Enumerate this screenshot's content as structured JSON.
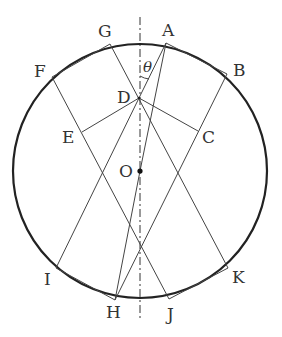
{
  "diagram": {
    "type": "geometry",
    "colors": {
      "stroke": "#333333",
      "circle": "#222222",
      "background": "#ffffff"
    },
    "circle": {
      "center_label": "O"
    },
    "points": {
      "A": "A",
      "B": "B",
      "C": "C",
      "D": "D",
      "E": "E",
      "F": "F",
      "G": "G",
      "H": "H",
      "I": "I",
      "J": "J",
      "K": "K",
      "O": "O"
    },
    "angle_label": "θ",
    "axis": "dash-dot vertical line through O"
  }
}
